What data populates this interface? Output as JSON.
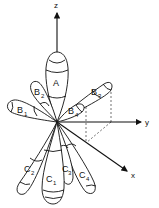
{
  "diagram": {
    "axes": {
      "z": "z",
      "y": "y",
      "x": "x"
    },
    "lobes": {
      "A": {
        "letter": "A",
        "sub": ""
      },
      "B1": {
        "letter": "B",
        "sub": "1"
      },
      "B2": {
        "letter": "B",
        "sub": "2"
      },
      "B3": {
        "letter": "B",
        "sub": "3"
      },
      "B4": {
        "letter": "B",
        "sub": "4"
      },
      "C1": {
        "letter": "C",
        "sub": "1"
      },
      "C2": {
        "letter": "C",
        "sub": "2"
      },
      "C3": {
        "letter": "C",
        "sub": "3"
      },
      "C4": {
        "letter": "C",
        "sub": "4"
      }
    },
    "colors": {
      "line": "#111111",
      "background": "#ffffff"
    }
  }
}
